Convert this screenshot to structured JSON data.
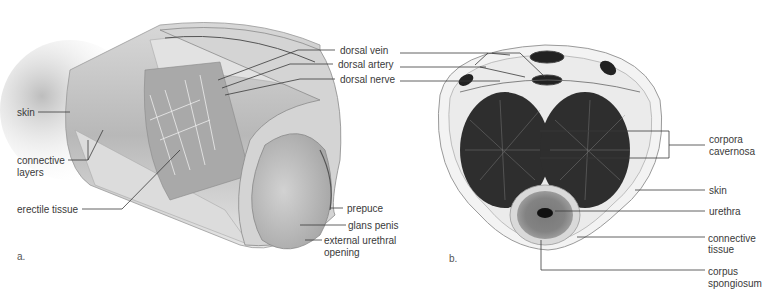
{
  "figure": {
    "panel_a": {
      "letter": "a.",
      "labels": {
        "dorsal_vein": "dorsal vein",
        "dorsal_artery": "dorsal artery",
        "dorsal_nerve": "dorsal nerve",
        "skin": "skin",
        "connective_layers_1": "connective",
        "connective_layers_2": "layers",
        "erectile_tissue": "erectile tissue",
        "prepuce": "prepuce",
        "glans_penis": "glans penis",
        "external_urethral_opening_1": "external urethral",
        "external_urethral_opening_2": "opening"
      }
    },
    "panel_b": {
      "letter": "b.",
      "labels": {
        "corpora_cavernosa_1": "corpora",
        "corpora_cavernosa_2": "cavernosa",
        "skin": "skin",
        "urethra": "urethra",
        "connective_tissue_1": "connective",
        "connective_tissue_2": "tissue",
        "corpus_spongiosum_1": "corpus",
        "corpus_spongiosum_2": "spongiosum"
      }
    }
  }
}
